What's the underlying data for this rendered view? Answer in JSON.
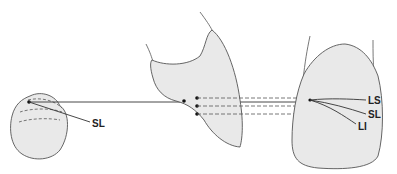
{
  "diagram": {
    "colors": {
      "fill": "#e9e9e9",
      "stroke": "#555555",
      "line": "#333333"
    },
    "labels": {
      "left_sl": "SL",
      "ls": "LS",
      "sl": "SL",
      "li": "LI"
    }
  }
}
